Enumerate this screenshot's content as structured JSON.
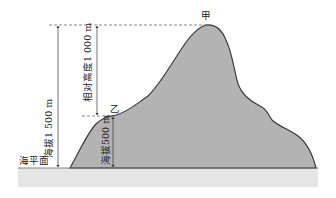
{
  "diagram": {
    "type": "altitude-relative-height",
    "labels": {
      "peak_a": "甲",
      "point_b": "乙",
      "sea_level": "海平面",
      "altitude_a": "海拔1 500 m",
      "relative_height": "相对高度1 000 m",
      "altitude_b": "海拔500 m"
    },
    "values": {
      "altitude_a_m": 1500,
      "altitude_b_m": 500,
      "relative_height_m": 1000
    },
    "colors": {
      "mountain_fill": "#b3b3b3",
      "mountain_outline": "#333333",
      "ground_band": "#e6e6e6",
      "sea_line": "#666666",
      "text": "#222222"
    }
  }
}
